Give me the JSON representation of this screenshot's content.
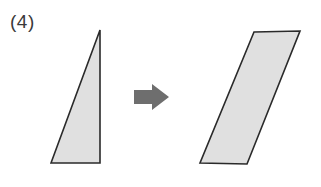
{
  "figure": {
    "label": "(4)",
    "label_color": "#3a3a3a"
  },
  "colors": {
    "shape_fill": "#e0e0e0",
    "shape_stroke": "#2a2a2a",
    "arrow_fill": "#6e6e6e",
    "background": "#ffffff"
  },
  "shapes": {
    "source": {
      "name": "right-triangle",
      "points": "51,163 100,30 100,163",
      "description": "right triangle, apex top-right, right angle bottom-right"
    },
    "target": {
      "name": "parallelogram",
      "points": "254,32 300,31 247,164 200,163",
      "description": "slanted parallelogram leaning right"
    },
    "arrow": {
      "name": "right-arrow",
      "points": "134,90 152,90 152,84 169,97 152,110 152,104 134,104",
      "direction": "right"
    }
  }
}
